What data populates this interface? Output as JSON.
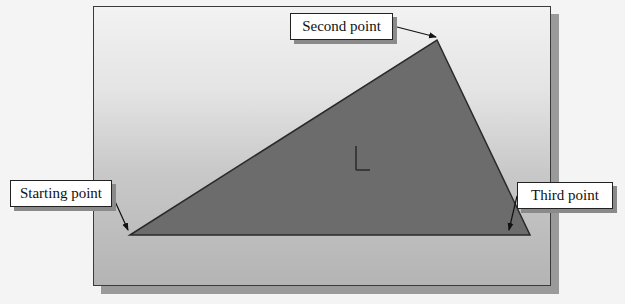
{
  "figure": {
    "colors": {
      "triangle_fill": "#6c6c6c",
      "triangle_edge": "#2a2a2a",
      "callout_background": "#ffffff",
      "callout_border": "#222222",
      "viewport_border": "#3a3a3a",
      "shadow": "#9a9a9a"
    }
  },
  "callouts": {
    "second_point": {
      "label": "Second point"
    },
    "starting_point": {
      "label": "Starting point"
    },
    "third_point": {
      "label": "Third point"
    }
  },
  "icons": {
    "origin": "coordinate-origin-icon"
  }
}
